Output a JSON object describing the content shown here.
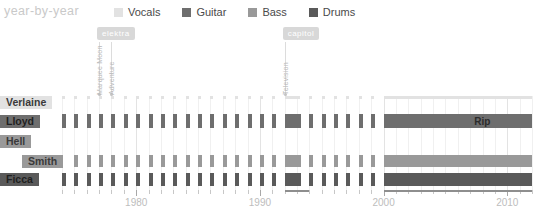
{
  "header": {
    "title": "year-by-year"
  },
  "legend": [
    {
      "label": "Vocals",
      "color": "#e2e2e2",
      "key": "vocals"
    },
    {
      "label": "Guitar",
      "color": "#6e6e6e",
      "key": "guitar"
    },
    {
      "label": "Bass",
      "color": "#999999",
      "key": "bass"
    },
    {
      "label": "Drums",
      "color": "#5a5a5a",
      "key": "drums"
    }
  ],
  "colors": {
    "vocals": "#e2e2e2",
    "guitar": "#6e6e6e",
    "bass": "#999999",
    "drums": "#5a5a5a",
    "grid": "#f0f0f0",
    "grid_decade": "#e3e3e3",
    "axis": "#8e8e8e",
    "axis_label": "#bdbdbd",
    "annotation": "#d8d8d8",
    "title": "#c9c9c9"
  },
  "annotations": [
    {
      "label": "elektra",
      "album": "Marquee Moon",
      "year": 1977,
      "badge": true
    },
    {
      "label": "",
      "album": "Adventure",
      "year": 1978,
      "badge": false
    },
    {
      "label": "capitol",
      "album": "Television",
      "year": 1992,
      "badge": true
    }
  ],
  "labels": {
    "rip": "Rip"
  },
  "chart_data": {
    "type": "bar",
    "title": "year-by-year",
    "xlabel": "",
    "ylabel": "",
    "xlim": [
      1974,
      2012
    ],
    "grid": true,
    "legend_position": "top",
    "tick_labels": [
      "1980",
      "1990",
      "2000",
      "2010"
    ],
    "tick_values": [
      1980,
      1990,
      2000,
      2010
    ],
    "minor_tick_step": 1,
    "rows": [
      {
        "name": "Verlaine",
        "instrument": "Vocals",
        "color": "#e2e2e2",
        "label_offset": 0,
        "active_years": [
          1974,
          1975,
          1976,
          1977,
          1978,
          1979,
          1980,
          1981,
          1982,
          1983,
          1984,
          1985,
          1986,
          1987,
          1988,
          1989,
          1990,
          1991,
          1992,
          1993,
          1994,
          1995,
          1996,
          1997,
          1998,
          1999,
          2000,
          2001,
          2002,
          2003,
          2004,
          2005,
          2006,
          2007,
          2008,
          2009,
          2010,
          2011
        ],
        "solid_blocks": [
          [
            1992,
            1993
          ],
          [
            2000,
            2012
          ]
        ],
        "bar_height": 3,
        "header_bar": [
          1974,
          1977
        ]
      },
      {
        "name": "Lloyd",
        "instrument": "Guitar",
        "color": "#6e6e6e",
        "label_offset": 0,
        "active_years": [
          1974,
          1975,
          1976,
          1977,
          1978,
          1979,
          1980,
          1981,
          1982,
          1983,
          1984,
          1985,
          1986,
          1987,
          1988,
          1989,
          1990,
          1991,
          1992,
          1993,
          1994,
          1995,
          1996,
          1997,
          1998,
          1999,
          2000,
          2001,
          2002,
          2003,
          2004,
          2005,
          2006,
          2007,
          2008,
          2009,
          2010,
          2011
        ],
        "solid_blocks": [
          [
            1992,
            1993
          ],
          [
            2000,
            2012
          ]
        ],
        "bar_height": 14,
        "header_bar": [
          1974,
          1977
        ],
        "note": "Rip",
        "note_year": 2007
      },
      {
        "name": "Hell",
        "instrument": "Bass",
        "color": "#999999",
        "label_offset": 0,
        "active_years": [],
        "solid_blocks": [],
        "bar_height": 12,
        "header_bar": [
          1974,
          1975
        ]
      },
      {
        "name": "Smith",
        "instrument": "Bass",
        "color": "#999999",
        "label_offset": 22,
        "active_years": [
          1975,
          1976,
          1977,
          1978,
          1979,
          1980,
          1981,
          1982,
          1983,
          1984,
          1985,
          1986,
          1987,
          1988,
          1989,
          1990,
          1991,
          1992,
          1993,
          1994,
          1995,
          1996,
          1997,
          1998,
          1999,
          2000,
          2001,
          2002,
          2003,
          2004,
          2005,
          2006,
          2007,
          2008,
          2009,
          2010,
          2011
        ],
        "solid_blocks": [
          [
            1992,
            1993
          ],
          [
            2000,
            2012
          ]
        ],
        "bar_height": 12,
        "header_bar": [
          1975,
          1978
        ]
      },
      {
        "name": "Ficca",
        "instrument": "Drums",
        "color": "#5a5a5a",
        "label_offset": 0,
        "active_years": [
          1974,
          1975,
          1976,
          1977,
          1978,
          1979,
          1980,
          1981,
          1982,
          1983,
          1984,
          1985,
          1986,
          1987,
          1988,
          1989,
          1990,
          1991,
          1992,
          1993,
          1994,
          1995,
          1996,
          1997,
          1998,
          1999,
          2000,
          2001,
          2002,
          2003,
          2004,
          2005,
          2006,
          2007,
          2008,
          2009,
          2010,
          2011
        ],
        "solid_blocks": [
          [
            1992,
            1993
          ],
          [
            2000,
            2012
          ]
        ],
        "bar_height": 13,
        "header_bar": [
          1974,
          1977
        ]
      }
    ]
  }
}
